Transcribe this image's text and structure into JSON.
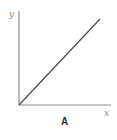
{
  "diagram": {
    "panel_label": "A",
    "x_axis_label": "x",
    "y_axis_label": "y",
    "relationship": "linear, directly proportional (line through origin)",
    "colors": {
      "axis": "#8c8c8c",
      "line": "#4a4a4a",
      "label": "#333333"
    }
  }
}
